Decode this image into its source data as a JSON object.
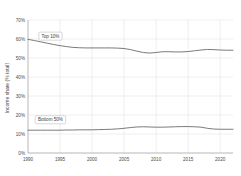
{
  "chart_data": {
    "type": "line",
    "title": "",
    "xlabel": "",
    "ylabel": "Income share (% total)",
    "xlim": [
      1990,
      2022
    ],
    "ylim": [
      0,
      70
    ],
    "grid": true,
    "legend_position": "inline-annotations",
    "x_ticks": [
      "1990",
      "1995",
      "2000",
      "2005",
      "2010",
      "2015",
      "2020"
    ],
    "x_tick_values": [
      1990,
      1995,
      2000,
      2005,
      2010,
      2015,
      2020
    ],
    "y_ticks": [
      "0%",
      "10%",
      "20%",
      "30%",
      "40%",
      "50%",
      "60%",
      "70%"
    ],
    "y_tick_values": [
      0,
      10,
      20,
      30,
      40,
      50,
      60,
      70
    ],
    "x": [
      1990,
      1991,
      1992,
      1993,
      1994,
      1995,
      1996,
      1997,
      1998,
      1999,
      2000,
      2001,
      2002,
      2003,
      2004,
      2005,
      2006,
      2007,
      2008,
      2009,
      2010,
      2011,
      2012,
      2013,
      2014,
      2015,
      2016,
      2017,
      2018,
      2019,
      2020,
      2021,
      2022
    ],
    "series": [
      {
        "name": "Top 10%",
        "annotation": "Top 10%",
        "color": "#6b6b6b",
        "values": [
          59.8,
          59.2,
          58.5,
          57.8,
          57.1,
          56.5,
          56.0,
          55.6,
          55.4,
          55.3,
          55.3,
          55.3,
          55.3,
          55.3,
          55.2,
          55.0,
          54.4,
          53.6,
          52.9,
          52.6,
          52.9,
          53.3,
          53.3,
          53.2,
          53.2,
          53.4,
          53.8,
          54.2,
          54.5,
          54.4,
          54.2,
          54.1,
          54.1
        ]
      },
      {
        "name": "Bottom 50%",
        "annotation": "Bottom 50%",
        "color": "#6b6b6b",
        "values": [
          12.0,
          12.0,
          12.0,
          12.0,
          12.0,
          12.0,
          12.1,
          12.1,
          12.2,
          12.2,
          12.2,
          12.3,
          12.4,
          12.5,
          12.7,
          13.0,
          13.4,
          13.7,
          13.8,
          13.7,
          13.6,
          13.6,
          13.7,
          13.8,
          13.9,
          13.9,
          13.8,
          13.6,
          13.0,
          12.6,
          12.5,
          12.5,
          12.5
        ]
      }
    ],
    "annotations": [
      {
        "label": "Top 10%",
        "x": 1993.5,
        "y": 61.5
      },
      {
        "label": "Bottom 50%",
        "x": 1993.5,
        "y": 17.5
      }
    ]
  }
}
